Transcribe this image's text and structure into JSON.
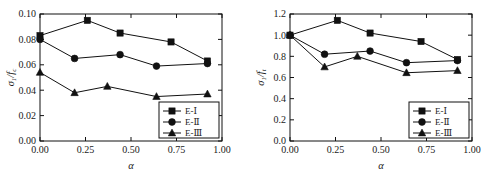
{
  "figure": {
    "panel_count": 2,
    "background": "#ffffff",
    "ink_color": "#111111"
  },
  "chart_data": [
    {
      "id": "left-panel",
      "type": "line",
      "title": "",
      "xlabel": "α",
      "ylabel": "σ1/fc",
      "ylabel_parts": {
        "numerator": "σ",
        "num_sub": "1",
        "slash": "/",
        "denominator": "f",
        "den_sub": "c"
      },
      "xlim": [
        0.0,
        1.0
      ],
      "ylim": [
        0.0,
        0.1
      ],
      "xticks": [
        "0.00",
        "0.25",
        "0.50",
        "0.75",
        "1.00"
      ],
      "xtick_values": [
        0.0,
        0.25,
        0.5,
        0.75,
        1.0
      ],
      "yticks": [
        "0.00",
        "0.02",
        "0.04",
        "0.06",
        "0.08",
        "0.10"
      ],
      "ytick_values": [
        0.0,
        0.02,
        0.04,
        0.06,
        0.08,
        0.1
      ],
      "grid": false,
      "legend_position": "lower right",
      "x": [
        0.0,
        0.19,
        0.26,
        0.37,
        0.44,
        0.64,
        0.72,
        0.92
      ],
      "series": [
        {
          "name": "E-Ⅰ",
          "marker": "square",
          "x": [
            0.0,
            0.26,
            0.44,
            0.72,
            0.92
          ],
          "values": [
            0.083,
            0.095,
            0.085,
            0.078,
            0.063
          ]
        },
        {
          "name": "E-Ⅱ",
          "marker": "circle",
          "x": [
            0.0,
            0.19,
            0.44,
            0.64,
            0.92
          ],
          "values": [
            0.08,
            0.065,
            0.068,
            0.059,
            0.061
          ]
        },
        {
          "name": "E-Ⅲ",
          "marker": "triangle",
          "x": [
            0.0,
            0.19,
            0.37,
            0.64,
            0.92
          ],
          "values": [
            0.054,
            0.038,
            0.043,
            0.035,
            0.037
          ]
        }
      ]
    },
    {
      "id": "right-panel",
      "type": "line",
      "title": "",
      "xlabel": "α",
      "ylabel": "σ1/ft",
      "ylabel_parts": {
        "numerator": "σ",
        "num_sub": "1",
        "slash": "/",
        "denominator": "f",
        "den_sub": "t"
      },
      "xlim": [
        0.0,
        1.0
      ],
      "ylim": [
        0.0,
        1.2
      ],
      "xticks": [
        "0.00",
        "0.25",
        "0.50",
        "0.75",
        "1.00"
      ],
      "xtick_values": [
        0.0,
        0.25,
        0.5,
        0.75,
        1.0
      ],
      "yticks": [
        "0.0",
        "0.2",
        "0.4",
        "0.6",
        "0.8",
        "1.0",
        "1.2"
      ],
      "ytick_values": [
        0.0,
        0.2,
        0.4,
        0.6,
        0.8,
        1.0,
        1.2
      ],
      "grid": false,
      "legend_position": "lower right",
      "series": [
        {
          "name": "E-Ⅰ",
          "marker": "square",
          "x": [
            0.0,
            0.26,
            0.44,
            0.72,
            0.92
          ],
          "values": [
            1.0,
            1.14,
            1.02,
            0.94,
            0.77
          ]
        },
        {
          "name": "E-Ⅱ",
          "marker": "circle",
          "x": [
            0.0,
            0.19,
            0.44,
            0.64,
            0.92
          ],
          "values": [
            1.0,
            0.82,
            0.85,
            0.74,
            0.76
          ]
        },
        {
          "name": "E-Ⅲ",
          "marker": "triangle",
          "x": [
            0.0,
            0.19,
            0.37,
            0.64,
            0.92
          ],
          "values": [
            1.0,
            0.7,
            0.8,
            0.645,
            0.665
          ]
        }
      ]
    }
  ]
}
